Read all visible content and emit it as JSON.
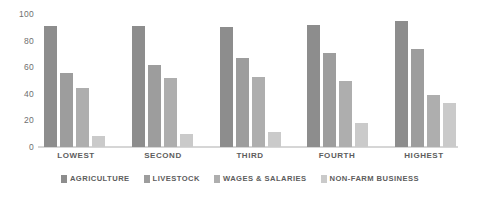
{
  "chart_data": {
    "type": "bar",
    "title": "",
    "subtitle": "",
    "xlabel": "",
    "ylabel": "",
    "ylim": [
      0,
      100
    ],
    "yticks": [
      "0",
      "20",
      "40",
      "60",
      "80",
      "100"
    ],
    "grid": false,
    "legend_position": "bottom",
    "categories": [
      "LOWEST",
      "SECOND",
      "THIRD",
      "FOURTH",
      "HIGHEST"
    ],
    "series": [
      {
        "name": "AGRICULTURE",
        "color": "#8d8d8d",
        "values": [
          91,
          91,
          90,
          92,
          95
        ]
      },
      {
        "name": "LIVESTOCK",
        "color": "#9d9d9d",
        "values": [
          56,
          62,
          67,
          71,
          74
        ]
      },
      {
        "name": "WAGES & SALARIES",
        "color": "#aeaeae",
        "values": [
          44,
          52,
          53,
          50,
          39
        ]
      },
      {
        "name": "NON-FARM BUSINESS",
        "color": "#cacaca",
        "values": [
          8,
          10,
          11,
          18,
          33
        ]
      }
    ]
  },
  "axis": {
    "baseline_color": "#d6d6d6",
    "tick_color": "#6f6f6f"
  }
}
